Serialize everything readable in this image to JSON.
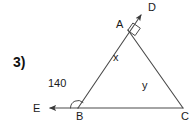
{
  "figure": {
    "question_number": "3)",
    "type": "geometry-diagram",
    "shape": "triangle",
    "line_color": "#4a4a4a",
    "text_color": "#1a1a1a",
    "background_color": "#ffffff",
    "vertices": [
      {
        "name": "A",
        "label": "A",
        "x": 128,
        "y": 30
      },
      {
        "name": "B",
        "label": "B",
        "x": 78,
        "y": 108
      },
      {
        "name": "C",
        "label": "C",
        "x": 183,
        "y": 108
      }
    ],
    "ray_endpoints": [
      {
        "name": "D",
        "label": "D",
        "x": 144,
        "y": 11
      },
      {
        "name": "E",
        "label": "E",
        "x": 46,
        "y": 108
      }
    ],
    "angle_labels": [
      {
        "name": "angle-x",
        "label": "x",
        "x": 113,
        "y": 52
      },
      {
        "name": "angle-y",
        "label": "y",
        "x": 142,
        "y": 80
      },
      {
        "name": "angle-b-exterior",
        "label": "140",
        "x": 48,
        "y": 78
      }
    ],
    "markers": {
      "right_angle_at": "A",
      "arc_at": "B"
    },
    "vertex_label_positions": {
      "A": {
        "x": 116,
        "y": 19
      },
      "B": {
        "x": 76,
        "y": 111
      },
      "C": {
        "x": 181,
        "y": 111
      },
      "D": {
        "x": 148,
        "y": 2
      },
      "E": {
        "x": 33,
        "y": 103
      }
    },
    "question_number_position": {
      "x": 13,
      "y": 55
    }
  }
}
